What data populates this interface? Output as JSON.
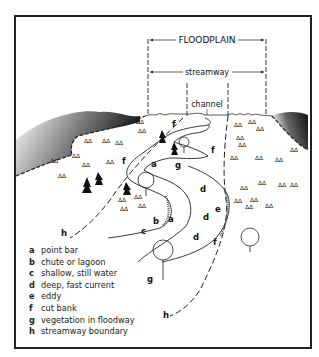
{
  "diagram": {
    "top_labels": {
      "floodplain": "FLOODPLAIN",
      "streamway": "streamway",
      "channel": "channel"
    },
    "map_labels": [
      {
        "key": "a",
        "x": 151,
        "y": 167
      },
      {
        "key": "a",
        "x": 170,
        "y": 222
      },
      {
        "key": "b",
        "x": 153,
        "y": 224
      },
      {
        "key": "c",
        "x": 141,
        "y": 234
      },
      {
        "key": "d",
        "x": 201,
        "y": 192
      },
      {
        "key": "d",
        "x": 204,
        "y": 220
      },
      {
        "key": "d",
        "x": 194,
        "y": 240
      },
      {
        "key": "e",
        "x": 215,
        "y": 211
      },
      {
        "key": "f",
        "x": 172,
        "y": 126
      },
      {
        "key": "f",
        "x": 123,
        "y": 164
      },
      {
        "key": "f",
        "x": 211,
        "y": 152
      },
      {
        "key": "f",
        "x": 214,
        "y": 245
      },
      {
        "key": "g",
        "x": 176,
        "y": 167
      },
      {
        "key": "g",
        "x": 148,
        "y": 281
      },
      {
        "key": "h",
        "x": 62,
        "y": 236
      },
      {
        "key": "h",
        "x": 164,
        "y": 318
      }
    ],
    "legend": [
      {
        "key": "a",
        "text": "point bar"
      },
      {
        "key": "b",
        "text": "chute or lagoon"
      },
      {
        "key": "c",
        "text": "shallow, still water"
      },
      {
        "key": "d",
        "text": "deep, fast current"
      },
      {
        "key": "e",
        "text": "eddy"
      },
      {
        "key": "f",
        "text": "cut bank"
      },
      {
        "key": "g",
        "text": "vegetation in floodway"
      },
      {
        "key": "h",
        "text": "streamway boundary"
      }
    ]
  }
}
